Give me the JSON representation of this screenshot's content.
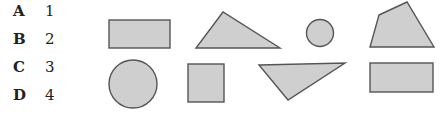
{
  "options": [
    {
      "letter": "A",
      "number": "1"
    },
    {
      "letter": "B",
      "number": "2"
    },
    {
      "letter": "C",
      "number": "3"
    },
    {
      "letter": "D",
      "number": "4"
    }
  ],
  "shapes": {
    "row1": [
      "rectangle",
      "triangle",
      "small-circle",
      "quadrilateral"
    ],
    "row2": [
      "large-circle",
      "square",
      "inverted-triangle",
      "rectangle"
    ]
  },
  "colors": {
    "fill": "#cfcfcf",
    "stroke": "#555555"
  }
}
